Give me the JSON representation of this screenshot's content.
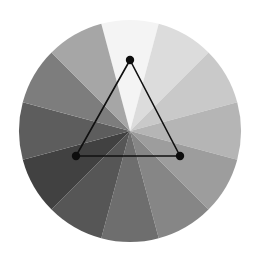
{
  "figure": {
    "background_color": "#ffffff",
    "width": 259,
    "height": 258
  },
  "wheel": {
    "name": "value-wheel",
    "center_x": 130,
    "center_y": 131,
    "radius": 111,
    "segment_count": 12,
    "segment_span_degrees": 30,
    "start_angle_degrees": -105,
    "outline": "none"
  },
  "chart_data": {
    "type": "pie",
    "xlabel": "",
    "ylabel": "",
    "grid": false,
    "legend": "none",
    "categories": [
      "sector-01",
      "sector-02",
      "sector-03",
      "sector-04",
      "sector-05",
      "sector-06",
      "sector-07",
      "sector-08",
      "sector-09",
      "sector-10",
      "sector-11",
      "sector-12"
    ],
    "values": [
      30,
      30,
      30,
      30,
      30,
      30,
      30,
      30,
      30,
      30,
      30,
      30
    ],
    "colors": [
      "#f4f4f4",
      "#dcdcdc",
      "#c9c9c9",
      "#b5b5b5",
      "#9d9d9d",
      "#868686",
      "#6e6e6e",
      "#565656",
      "#414141",
      "#5d5d5d",
      "#7d7d7d",
      "#a6a6a6"
    ],
    "segment_start_angles": [
      -105,
      -75,
      -45,
      -15,
      15,
      45,
      75,
      105,
      135,
      165,
      195,
      225
    ],
    "annotations": [
      {
        "name": "triad-triangle",
        "type": "polygon",
        "points": [
          [
            130,
            60
          ],
          [
            76,
            156
          ],
          [
            180,
            156
          ]
        ],
        "stroke": "#101010",
        "fill": "none"
      }
    ]
  },
  "triangle": {
    "name": "triad-triangle",
    "stroke_color": "#101010",
    "vertex_color": "#0d0d0d",
    "vertex_radius": 4.2,
    "vertices": [
      {
        "label": "vertex-top",
        "x": 130,
        "y": 60
      },
      {
        "label": "vertex-bottom-left",
        "x": 76,
        "y": 156
      },
      {
        "label": "vertex-bottom-right",
        "x": 180,
        "y": 156
      }
    ],
    "edges": [
      {
        "label": "edge-left",
        "from": 0,
        "to": 1
      },
      {
        "label": "edge-bottom",
        "from": 1,
        "to": 2
      },
      {
        "label": "edge-right",
        "from": 2,
        "to": 0
      }
    ]
  }
}
